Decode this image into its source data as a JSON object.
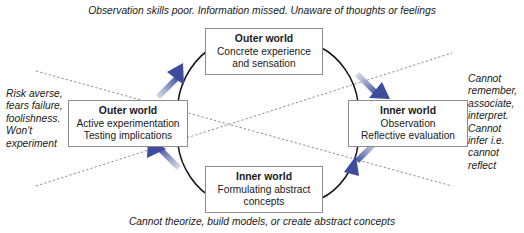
{
  "diagram": {
    "title_top_caption": "Observation skills poor. Information missed. Unaware of thoughts or feelings",
    "bottom_caption": "Cannot theorize, build models, or create abstract concepts",
    "colors": {
      "arrow_head": "#3d4c9c",
      "arrow_tail": "#cfd6e8",
      "box_border": "#8c8c8c",
      "curve": "#111111",
      "dashed_line": "#8a8a8a",
      "text": "#1a1a1a",
      "background": "#ffffff"
    },
    "nodes": {
      "top": {
        "title": "Outer world",
        "line1": "Concrete experience",
        "line2": "and sensation"
      },
      "right": {
        "title": "Inner world",
        "line1": "Observation",
        "line2": "Reflective evaluation"
      },
      "bottom": {
        "title": "Inner world",
        "line1": "Formulating abstract",
        "line2": "concepts"
      },
      "left": {
        "title": "Outer world",
        "line1": "Active experimentation",
        "line2": "Testing implications"
      }
    },
    "notes": {
      "left": {
        "line1": "Risk averse,",
        "line2": "fears failure,",
        "line3": "foolishness.",
        "line4": "Won't",
        "line5": "experiment"
      },
      "right": {
        "line1": "Cannot",
        "line2": "remember,",
        "line3": "associate,",
        "line4": "interpret.",
        "line5": "Cannot",
        "line6": "infer i.e.",
        "line7": "cannot",
        "line8": "reflect"
      }
    },
    "arrows": [
      {
        "name": "arrow-bottom-to-left",
        "direction": "up-left"
      },
      {
        "name": "arrow-left-to-top",
        "direction": "up-right"
      },
      {
        "name": "arrow-top-to-right",
        "direction": "down-right"
      },
      {
        "name": "arrow-right-to-bottom",
        "direction": "down-left"
      }
    ]
  }
}
